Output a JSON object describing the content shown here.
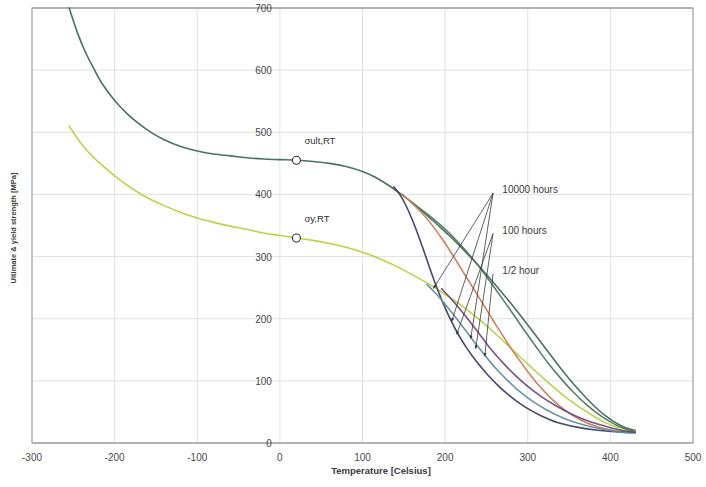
{
  "chart_data": {
    "type": "line",
    "title": "",
    "xlabel": "Temperature [Celsius]",
    "ylabel": "Ultimate & yield strength [MPa]",
    "xlim": [
      -300,
      500
    ],
    "ylim": [
      0,
      700
    ],
    "xticks": [
      -300,
      -200,
      -100,
      0,
      100,
      200,
      300,
      400,
      500
    ],
    "xtick_labels": [
      "-300",
      "-200",
      "-100",
      "0",
      "100",
      "200",
      "300",
      "400",
      "500"
    ],
    "yticks": [
      0,
      100,
      200,
      300,
      400,
      500,
      600,
      700
    ],
    "ytick_labels": [
      "0",
      "100",
      "200",
      "300",
      "400",
      "500",
      "600",
      "700"
    ],
    "grid": true,
    "legend_position": "none",
    "point_labels": [
      {
        "name": "sigma-ult-rt",
        "text": "σult,RT",
        "x": 20,
        "y": 455,
        "label_dx": 8,
        "label_dy": -16
      },
      {
        "name": "sigma-y-rt",
        "text": "σy,RT",
        "x": 20,
        "y": 330,
        "label_dx": 8,
        "label_dy": -16
      }
    ],
    "annotations": [
      {
        "name": "anno-10000-hours",
        "text": "10000 hours",
        "x": 262,
        "y": 408
      },
      {
        "name": "anno-100-hours",
        "text": "100 hours",
        "x": 262,
        "y": 343
      },
      {
        "name": "anno-half-hour",
        "text": "1/2 hour",
        "x": 262,
        "y": 278
      }
    ],
    "series": [
      {
        "name": "ultimate-strength",
        "label": "Ultimate strength (σult)",
        "color": "#3f6b55",
        "points": [
          [
            -255,
            700
          ],
          [
            -245,
            660
          ],
          [
            -235,
            628
          ],
          [
            -225,
            602
          ],
          [
            -215,
            578
          ],
          [
            -200,
            551
          ],
          [
            -185,
            530
          ],
          [
            -170,
            513
          ],
          [
            -155,
            499
          ],
          [
            -140,
            488
          ],
          [
            -120,
            477
          ],
          [
            -100,
            470
          ],
          [
            -80,
            465
          ],
          [
            -60,
            462
          ],
          [
            -40,
            459
          ],
          [
            -20,
            457
          ],
          [
            0,
            456
          ],
          [
            20,
            455
          ],
          [
            40,
            453
          ],
          [
            60,
            450
          ],
          [
            80,
            445
          ],
          [
            100,
            437
          ],
          [
            115,
            428
          ],
          [
            130,
            416
          ],
          [
            145,
            402
          ],
          [
            160,
            387
          ],
          [
            175,
            370
          ],
          [
            190,
            352
          ],
          [
            205,
            334
          ],
          [
            220,
            314
          ],
          [
            240,
            286
          ],
          [
            260,
            256
          ],
          [
            280,
            224
          ],
          [
            300,
            190
          ],
          [
            320,
            155
          ],
          [
            340,
            120
          ],
          [
            360,
            88
          ],
          [
            380,
            60
          ],
          [
            395,
            43
          ],
          [
            410,
            30
          ],
          [
            420,
            24
          ],
          [
            430,
            20
          ]
        ]
      },
      {
        "name": "yield-strength",
        "label": "Yield strength (σy)",
        "color": "#b5d13f",
        "points": [
          [
            -255,
            510
          ],
          [
            -245,
            490
          ],
          [
            -235,
            473
          ],
          [
            -225,
            459
          ],
          [
            -215,
            447
          ],
          [
            -200,
            430
          ],
          [
            -185,
            415
          ],
          [
            -170,
            402
          ],
          [
            -155,
            391
          ],
          [
            -140,
            382
          ],
          [
            -120,
            371
          ],
          [
            -100,
            362
          ],
          [
            -80,
            355
          ],
          [
            -60,
            349
          ],
          [
            -40,
            344
          ],
          [
            -20,
            338
          ],
          [
            0,
            334
          ],
          [
            20,
            330
          ],
          [
            40,
            326
          ],
          [
            60,
            321
          ],
          [
            80,
            315
          ],
          [
            100,
            307
          ],
          [
            120,
            297
          ],
          [
            140,
            285
          ],
          [
            160,
            271
          ],
          [
            180,
            256
          ],
          [
            200,
            239
          ],
          [
            220,
            221
          ],
          [
            240,
            200
          ],
          [
            260,
            177
          ],
          [
            280,
            152
          ],
          [
            300,
            127
          ],
          [
            320,
            103
          ],
          [
            340,
            80
          ],
          [
            360,
            60
          ],
          [
            380,
            43
          ],
          [
            395,
            32
          ],
          [
            410,
            25
          ],
          [
            420,
            21
          ],
          [
            430,
            19
          ]
        ]
      },
      {
        "name": "creep-ultimate-half-hour",
        "label": "1/2 hour (ultimate branch)",
        "color": "#4d7a5c",
        "points": [
          [
            160,
            387
          ],
          [
            175,
            372
          ],
          [
            190,
            356
          ],
          [
            205,
            338
          ],
          [
            220,
            317
          ],
          [
            235,
            294
          ],
          [
            250,
            268
          ],
          [
            265,
            240
          ],
          [
            280,
            212
          ],
          [
            295,
            183
          ],
          [
            310,
            155
          ],
          [
            325,
            128
          ],
          [
            340,
            104
          ],
          [
            355,
            82
          ],
          [
            370,
            63
          ],
          [
            385,
            47
          ],
          [
            400,
            34
          ],
          [
            412,
            26
          ],
          [
            422,
            21
          ],
          [
            430,
            19
          ]
        ]
      },
      {
        "name": "creep-100-hours",
        "label": "100 hours",
        "color": "#c97a52",
        "points": [
          [
            148,
            400
          ],
          [
            160,
            386
          ],
          [
            172,
            370
          ],
          [
            184,
            351
          ],
          [
            196,
            329
          ],
          [
            208,
            305
          ],
          [
            220,
            279
          ],
          [
            234,
            249
          ],
          [
            248,
            219
          ],
          [
            262,
            189
          ],
          [
            276,
            160
          ],
          [
            290,
            133
          ],
          [
            304,
            108
          ],
          [
            318,
            86
          ],
          [
            332,
            67
          ],
          [
            348,
            50
          ],
          [
            364,
            37
          ],
          [
            380,
            28
          ],
          [
            396,
            22
          ],
          [
            412,
            19
          ],
          [
            430,
            18
          ]
        ]
      },
      {
        "name": "creep-10000-hours",
        "label": "10000 hours",
        "color": "#3b3f63",
        "points": [
          [
            138,
            412
          ],
          [
            146,
            398
          ],
          [
            153,
            381
          ],
          [
            160,
            360
          ],
          [
            167,
            336
          ],
          [
            174,
            310
          ],
          [
            181,
            283
          ],
          [
            188,
            257
          ],
          [
            196,
            230
          ],
          [
            205,
            203
          ],
          [
            215,
            177
          ],
          [
            226,
            153
          ],
          [
            238,
            131
          ],
          [
            252,
            109
          ],
          [
            266,
            90
          ],
          [
            282,
            72
          ],
          [
            298,
            57
          ],
          [
            316,
            44
          ],
          [
            336,
            33
          ],
          [
            358,
            26
          ],
          [
            382,
            21
          ],
          [
            406,
            18
          ],
          [
            430,
            17
          ]
        ]
      },
      {
        "name": "creep-yield-10000-hours",
        "label": "10000 hours (yield branch)",
        "color": "#5f8fa0",
        "points": [
          [
            178,
            255
          ],
          [
            190,
            239
          ],
          [
            202,
            220
          ],
          [
            214,
            200
          ],
          [
            226,
            179
          ],
          [
            238,
            158
          ],
          [
            250,
            138
          ],
          [
            262,
            119
          ],
          [
            276,
            100
          ],
          [
            290,
            83
          ],
          [
            306,
            67
          ],
          [
            322,
            54
          ],
          [
            340,
            42
          ],
          [
            360,
            32
          ],
          [
            380,
            25
          ],
          [
            400,
            20
          ],
          [
            415,
            17
          ],
          [
            430,
            16
          ]
        ]
      },
      {
        "name": "creep-yield-100-hours",
        "label": "100 hours (yield branch)",
        "color": "#6f4b7c",
        "points": [
          [
            196,
            248
          ],
          [
            208,
            231
          ],
          [
            220,
            212
          ],
          [
            232,
            192
          ],
          [
            244,
            171
          ],
          [
            256,
            150
          ],
          [
            270,
            129
          ],
          [
            284,
            110
          ],
          [
            300,
            91
          ],
          [
            316,
            75
          ],
          [
            334,
            60
          ],
          [
            354,
            46
          ],
          [
            374,
            35
          ],
          [
            394,
            27
          ],
          [
            412,
            21
          ],
          [
            430,
            17
          ]
        ]
      }
    ],
    "leaders": [
      {
        "name": "leader-10000-a",
        "from": [
          258,
          402
        ],
        "to": [
          186,
          249
        ]
      },
      {
        "name": "leader-10000-b",
        "from": [
          258,
          402
        ],
        "to": [
          208,
          196
        ]
      },
      {
        "name": "leader-10000-c",
        "from": [
          258,
          402
        ],
        "to": [
          231,
          168
        ]
      },
      {
        "name": "leader-100-a",
        "from": [
          258,
          337
        ],
        "to": [
          214,
          175
        ]
      },
      {
        "name": "leader-100-b",
        "from": [
          258,
          337
        ],
        "to": [
          237,
          152
        ]
      },
      {
        "name": "leader-half-a",
        "from": [
          258,
          272
        ],
        "to": [
          248,
          140
        ]
      }
    ],
    "arrow_tips": [
      {
        "name": "arrow-tip-1",
        "x": 186,
        "y": 249
      },
      {
        "name": "arrow-tip-2",
        "x": 208,
        "y": 196
      },
      {
        "name": "arrow-tip-3",
        "x": 231,
        "y": 168
      },
      {
        "name": "arrow-tip-4",
        "x": 214,
        "y": 175
      },
      {
        "name": "arrow-tip-5",
        "x": 237,
        "y": 152
      },
      {
        "name": "arrow-tip-6",
        "x": 248,
        "y": 140
      }
    ]
  }
}
